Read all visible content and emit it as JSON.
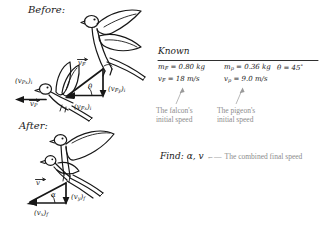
{
  "page": {
    "background": "#ffffff",
    "ink_color": "#171717",
    "annotation_color": "#8c8c8c"
  },
  "sections": {
    "before_label": "Before:",
    "after_label": "After:",
    "known_label": "Known",
    "find_label": "Find:"
  },
  "known": {
    "rows": [
      {
        "mass_falcon": "m",
        "mass_falcon_sub": "F",
        "mass_falcon_value": "= 0.80 kg",
        "mass_pigeon": "m",
        "mass_pigeon_sub": "p",
        "mass_pigeon_value": "= 0.36 kg",
        "angle": "θ",
        "angle_value": "= 45",
        "angle_unit": "°"
      },
      {
        "speed_falcon": "v",
        "speed_falcon_sub": "F",
        "speed_falcon_value": "= 18 m/s",
        "speed_pigeon": "v",
        "speed_pigeon_sub": "p",
        "speed_pigeon_value": "= 9.0 m/s"
      }
    ]
  },
  "annotations": {
    "falcon_note_line1": "The falcon's",
    "falcon_note_line2": "initial speed",
    "pigeon_note_line1": "The pigeon's",
    "pigeon_note_line2": "initial speed"
  },
  "find": {
    "unknowns": "α, v",
    "arrow": "←—",
    "note": "The combined final speed"
  },
  "before_diagram": {
    "labels": {
      "pigeon_x_component": "(v",
      "pigeon_x_component_sub": "Px",
      "pigeon_x_component_suffix": ")",
      "pigeon_x_component_sub2": "i",
      "pigeon_vector": "v",
      "pigeon_vector_sub": "P",
      "theta": "θ",
      "falcon_y_component": "(v",
      "falcon_y_component_sub": "Fy",
      "falcon_y_component_suffix": ")",
      "falcon_y_component_sub2": "i",
      "falcon_x_component": "(v",
      "falcon_x_component_sub": "Fx",
      "falcon_x_component_suffix": ")",
      "falcon_x_component_sub2": "i",
      "falcon_vector": "v",
      "falcon_vector_sub": "F"
    }
  },
  "after_diagram": {
    "labels": {
      "final_vector": "v",
      "alpha": "α",
      "final_y_component": "(v",
      "final_y_component_sub": "y",
      "final_y_component_suffix": ")",
      "final_y_component_sub2": "f",
      "final_x_component": "(v",
      "final_x_component_sub": "x",
      "final_x_component_suffix": ")",
      "final_x_component_sub2": "f"
    }
  }
}
